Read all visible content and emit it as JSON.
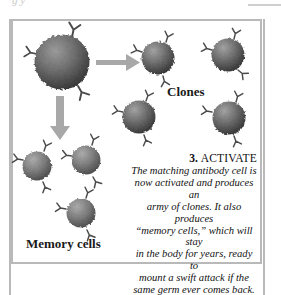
{
  "page": {
    "top_clipped_text": "g   y",
    "background_color": "#ffffff",
    "rule_color": "#b9b9b9"
  },
  "illustration": {
    "frame_color": "#b9b9b9",
    "arrow_color": "#a8a8a8",
    "cell_color_light": "#8e8e8e",
    "cell_color_dark": "#3a3a3a",
    "antibody_color": "#4a4a4a",
    "labels": {
      "clones": "Clones",
      "memory_cells": "Memory cells"
    },
    "cells": {
      "parent": {
        "cx": 62,
        "cy": 62,
        "r": 28
      },
      "clones": [
        {
          "cx": 158,
          "cy": 58,
          "r": 17
        },
        {
          "cx": 228,
          "cy": 55,
          "r": 17
        },
        {
          "cx": 139,
          "cy": 117,
          "r": 17
        },
        {
          "cx": 229,
          "cy": 118,
          "r": 17
        }
      ],
      "memory": [
        {
          "cx": 37,
          "cy": 166,
          "r": 15
        },
        {
          "cx": 86,
          "cy": 160,
          "r": 15
        },
        {
          "cx": 81,
          "cy": 213,
          "r": 15
        }
      ]
    },
    "arrows": [
      {
        "name": "arrow-right",
        "direction": "right"
      },
      {
        "name": "arrow-down",
        "direction": "down"
      }
    ]
  },
  "caption": {
    "step_number": "3.",
    "step_title": "ACTIVATE",
    "lines": [
      "The matching antibody cell is",
      "now activated and produces an",
      "army of clones. It also produces",
      "“memory cells,” which will stay",
      "in the body for years, ready to",
      "mount a swift attack if the",
      "same germ ever comes back."
    ]
  }
}
